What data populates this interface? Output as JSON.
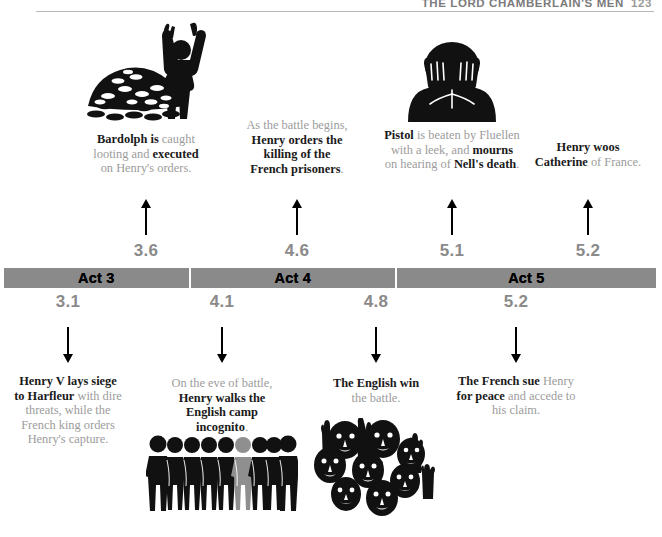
{
  "runninghead": {
    "title": "THE LORD CHAMBERLAIN'S MEN",
    "folio": "123"
  },
  "timeline": {
    "acts": [
      {
        "label": "Act 3",
        "flex": 28.5
      },
      {
        "label": "Act 4",
        "flex": 31.5
      },
      {
        "label": "Act 5",
        "flex": 40.0
      }
    ]
  },
  "above": {
    "events": [
      {
        "scene": "3.6",
        "illustration": "coins-pile-with-cheering-figure",
        "caption_html": "<b>Bardolph is</b> caught<br>looting and <b>executed</b><br>on Henry's orders."
      },
      {
        "scene": "4.6",
        "illustration": "none",
        "caption_html": "As the battle begins,<br><b>Henry orders the<br>killing of the<br>French prisoners</b>."
      },
      {
        "scene": "5.1",
        "illustration": "mourning-figure-hands-on-face",
        "caption_html": "<b>Pistol</b> is beaten by Fluellen<br>with a leek, and <b>mourns</b><br>on hearing of <b>Nell's death</b>."
      },
      {
        "scene": "5.2",
        "illustration": "none",
        "caption_html": "<b>Henry woos<br>Catherine</b> of France."
      }
    ]
  },
  "below": {
    "events": [
      {
        "scene": "3.1",
        "illustration": "none",
        "caption_html": "<b>Henry V lays siege<br>to Harfleur</b> with dire<br>threats, while the<br>French king orders<br>Henry's capture."
      },
      {
        "scene": "4.1",
        "illustration": "row-of-soldiers-one-highlighted",
        "caption_html": "On the eve of battle,<br><b>Henry walks the<br>English camp<br>incognito</b>."
      },
      {
        "scene": "4.8",
        "illustration": "cheering-crowd-of-faces",
        "caption_html": "<b>The English win</b><br>the battle."
      },
      {
        "scene": "5.2",
        "illustration": "none",
        "caption_html": "<b>The French sue</b> Henry<br><b>for peace</b> and accede to<br>his claim."
      }
    ]
  },
  "colors": {
    "bar": "#8a8a8a",
    "scene_number": "#8a8a8a",
    "body_text": "#9c9c9c",
    "bold_text": "#1a1a1a",
    "rule": "#b9b9b9"
  }
}
